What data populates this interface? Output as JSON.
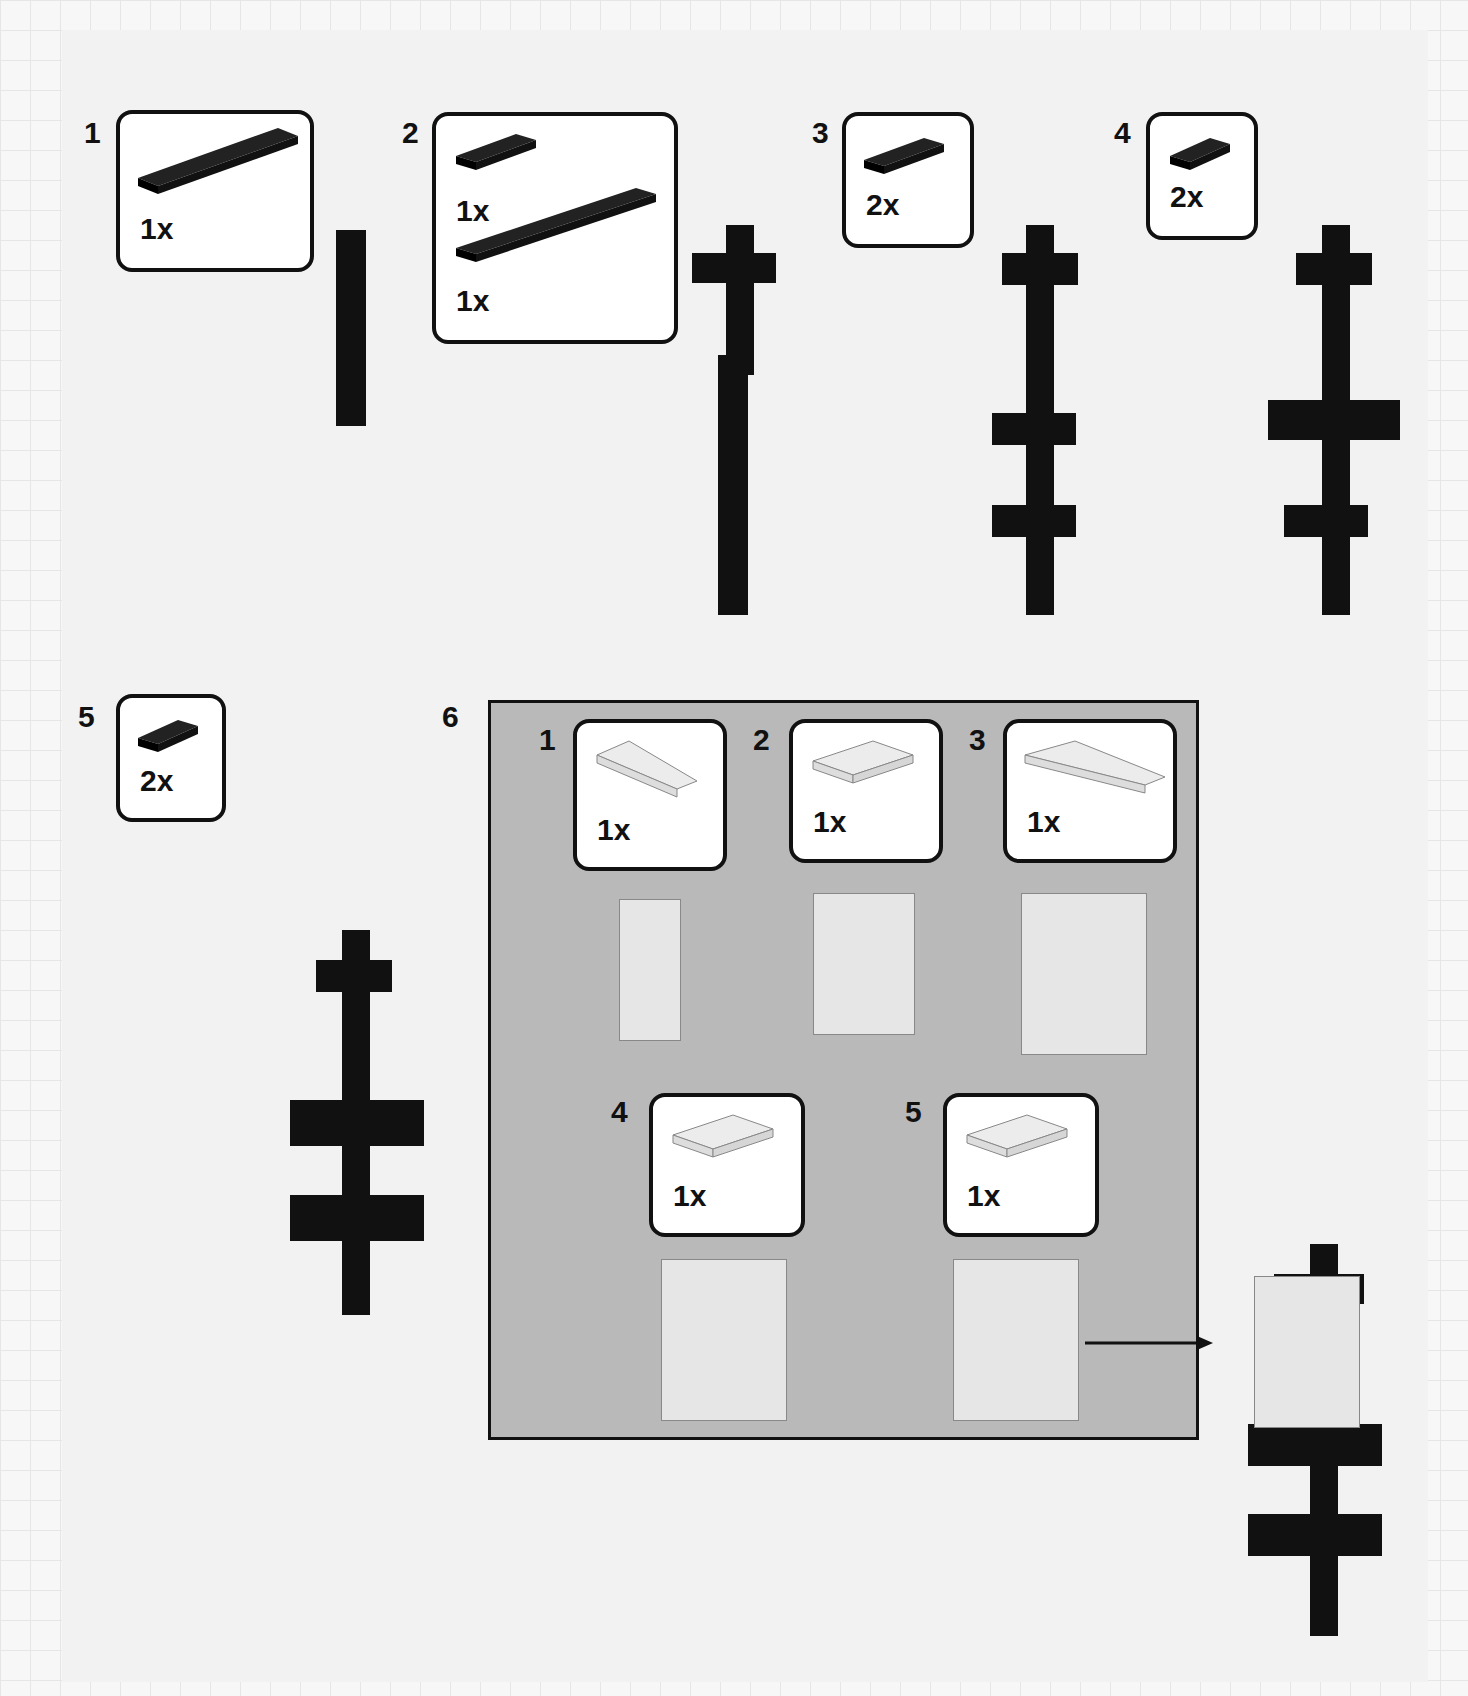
{
  "page": {
    "type": "building-instructions",
    "colors": {
      "brick_dark": "#111111",
      "brick_light": "#e8e8e8",
      "subassembly_bg": "#b9b9b9",
      "callout_bg": "#ffffff"
    }
  },
  "steps": [
    {
      "number": "1",
      "parts": [
        {
          "icon": "black-plate-1x6-icon",
          "qty": "1x"
        }
      ]
    },
    {
      "number": "2",
      "parts": [
        {
          "icon": "black-plate-1x3-icon",
          "qty": "1x"
        },
        {
          "icon": "black-plate-1x8-icon",
          "qty": "1x"
        }
      ]
    },
    {
      "number": "3",
      "parts": [
        {
          "icon": "black-plate-1x3-icon",
          "qty": "2x"
        }
      ]
    },
    {
      "number": "4",
      "parts": [
        {
          "icon": "black-plate-1x2-icon",
          "qty": "2x"
        }
      ]
    },
    {
      "number": "5",
      "parts": [
        {
          "icon": "black-plate-1x2-icon",
          "qty": "2x"
        }
      ]
    },
    {
      "number": "6",
      "subassembly": {
        "steps": [
          {
            "number": "1",
            "parts": [
              {
                "icon": "white-wedge-plate-icon",
                "qty": "1x"
              }
            ]
          },
          {
            "number": "2",
            "parts": [
              {
                "icon": "white-plate-2x3-icon",
                "qty": "1x"
              }
            ]
          },
          {
            "number": "3",
            "parts": [
              {
                "icon": "white-wedge-plate-notched-icon",
                "qty": "1x"
              }
            ]
          },
          {
            "number": "4",
            "parts": [
              {
                "icon": "white-plate-2x3-icon",
                "qty": "1x"
              }
            ]
          },
          {
            "number": "5",
            "parts": [
              {
                "icon": "white-plate-2x3-icon",
                "qty": "1x"
              }
            ]
          }
        ]
      }
    }
  ]
}
